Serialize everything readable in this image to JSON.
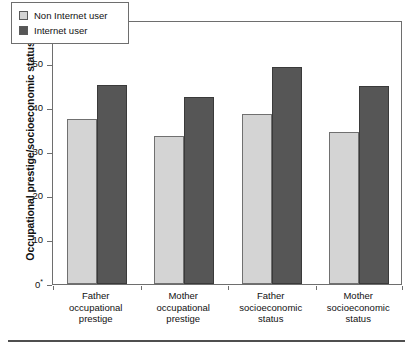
{
  "chart_data": {
    "type": "bar",
    "title": "",
    "xlabel": "",
    "ylabel": "Occupational prestige/socioeconomic status",
    "ylim": [
      0,
      60
    ],
    "yticks": [
      "0*",
      "10",
      "20",
      "30",
      "40",
      "50",
      "60"
    ],
    "ytick_values": [
      0,
      10,
      20,
      30,
      40,
      50,
      60
    ],
    "grid": false,
    "legend_position": "top-left",
    "categories": [
      "Father occupational prestige",
      "Mother occupational prestige",
      "Father socioeconomic status",
      "Mother socioeconomic status"
    ],
    "category_lines": [
      [
        "Father",
        "occupational",
        "prestige"
      ],
      [
        "Mother",
        "occupational",
        "prestige"
      ],
      [
        "Father",
        "socioeconomic",
        "status"
      ],
      [
        "Mother",
        "socioeconomic",
        "status"
      ]
    ],
    "series": [
      {
        "name": "Non Internet user",
        "color": "#d4d4d4",
        "values": [
          37.5,
          33.6,
          38.7,
          34.5
        ]
      },
      {
        "name": "Internet user",
        "color": "#565656",
        "values": [
          45.2,
          42.4,
          49.3,
          45.0
        ]
      }
    ]
  },
  "legend": {
    "items": [
      {
        "label": "Non Internet user",
        "swatch": "light"
      },
      {
        "label": "Internet user",
        "swatch": "dark"
      }
    ]
  },
  "axis": {
    "y_title": "Occupational prestige/socioeconomic status"
  }
}
